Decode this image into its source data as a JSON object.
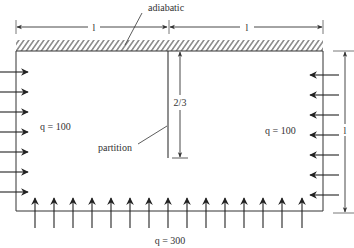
{
  "diagram": {
    "type": "heat-transfer-enclosure",
    "labels": {
      "adiabatic": "adiabatic",
      "top_left_length": "l",
      "top_right_length": "l",
      "right_length": "l",
      "partition_height": "2/3",
      "partition": "partition",
      "left_flux": "q = 100",
      "right_flux": "q = 100",
      "bottom_flux": "q = 300"
    },
    "boundaries": {
      "top": "adiabatic (hatched wall)",
      "left": "heat flux inward, q = 100",
      "right": "heat flux inward, q = 100",
      "bottom": "heat flux inward, q = 300"
    },
    "arrow_counts": {
      "left": 7,
      "right": 7,
      "bottom": 15
    },
    "colors": {
      "line": "#333333",
      "hatch": "#444444",
      "background": "#ffffff"
    }
  }
}
